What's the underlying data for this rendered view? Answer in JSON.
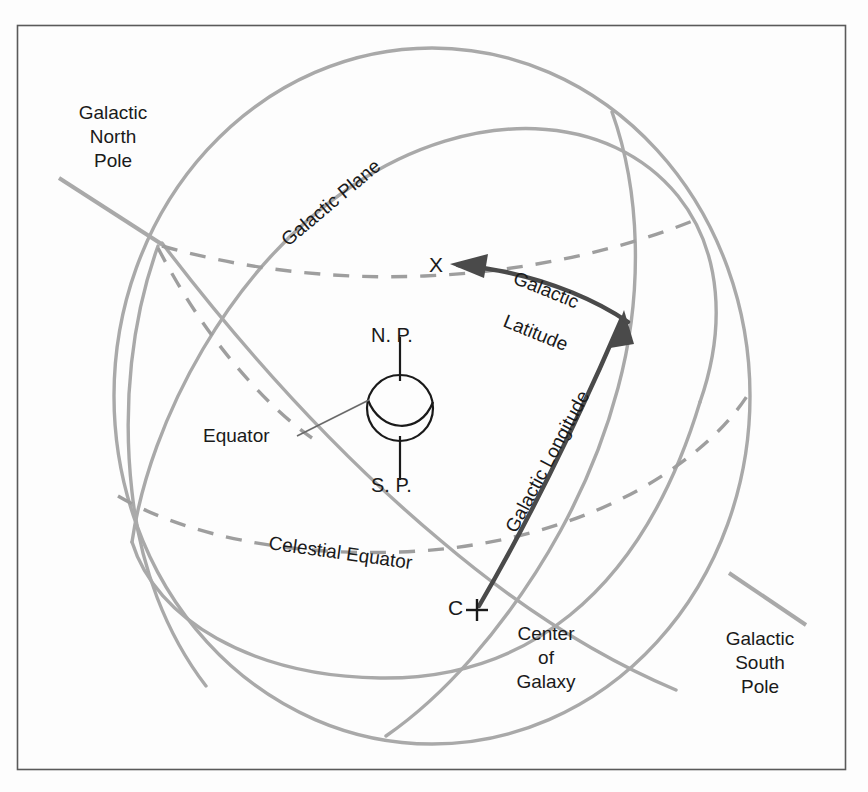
{
  "figure": {
    "background_color": "#fdfdfd",
    "frame_color": "#4a4a4a",
    "sphere_line_color": "#a8a8a8",
    "dashed_line_color": "#9a9a9a",
    "highlight_color": "#4a4a4a",
    "earth_line_color": "#1a1a1a",
    "text_color": "#1a1a1a"
  },
  "labels": {
    "galactic_north_pole": "Galactic\nNorth\nPole",
    "galactic_north_pole_lines": [
      "Galactic",
      "North",
      "Pole"
    ],
    "galactic_south_pole_lines": [
      "Galactic",
      "South",
      "Pole"
    ],
    "galactic_plane": "Galactic Plane",
    "celestial_equator": "Celestial Equator",
    "galactic_latitude_line1": "Galactic",
    "galactic_latitude_line2": "Latitude",
    "galactic_longitude": "Galactic  Longitude",
    "north_pole_abbrev": "N. P.",
    "south_pole_abbrev": "S. P.",
    "equator": "Equator",
    "point_x": "X",
    "point_c": "C",
    "center_of_galaxy_lines": [
      "Center",
      "of",
      "Galaxy"
    ]
  },
  "diagram_data": {
    "type": "astronomy-schematic",
    "frame": {
      "x": 17,
      "y": 25,
      "width": 829,
      "height": 745
    },
    "celestial_sphere": {
      "cx": 432,
      "cy": 396,
      "rx": 318,
      "ry": 348
    },
    "earth": {
      "cx": 400,
      "cy": 408,
      "r": 33
    },
    "point_x": {
      "x": 436,
      "y": 264
    },
    "point_c": {
      "x": 480,
      "y": 609
    },
    "great_circles": [
      {
        "name": "galactic-plane",
        "style": "solid",
        "color": "#a8a8a8"
      },
      {
        "name": "celestial-equator",
        "style": "dashed",
        "color": "#9a9a9a"
      },
      {
        "name": "galactic-meridian",
        "style": "solid",
        "color": "#a8a8a8"
      },
      {
        "name": "galactic-longitude-arc",
        "style": "solid",
        "color": "#4a4a4a"
      },
      {
        "name": "galactic-latitude-arc",
        "style": "solid",
        "color": "#4a4a4a"
      }
    ]
  }
}
